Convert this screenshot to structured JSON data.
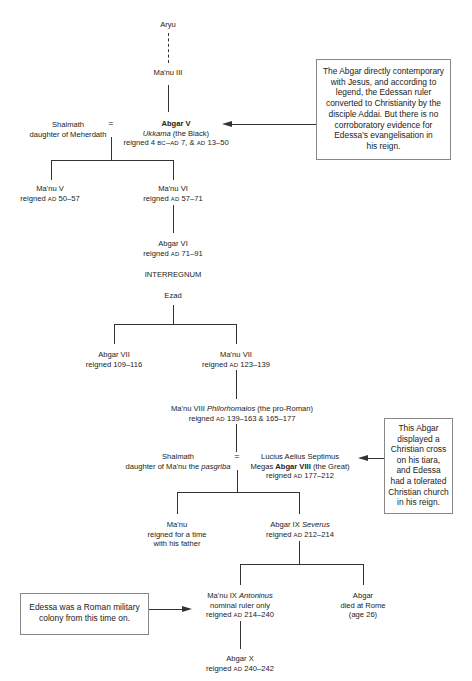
{
  "tree": {
    "aryu": "Aryu",
    "manu3": "Ma'nu III",
    "shalmath1": {
      "name": "Shalmath",
      "desc": "daughter of Meherdath"
    },
    "marriage_sign": "=",
    "abgar5": {
      "name": "Abgar V",
      "epithet": "Ukkama",
      "epithet_note": " (the Black)",
      "reign_pre": "reigned 4 ",
      "bc": "BC",
      "dash": "–",
      "ad1": "AD",
      "reign_mid": " 7, & ",
      "ad2": "AD",
      "reign_end": " 13–50"
    },
    "manu5": {
      "name": "Ma'nu V",
      "reign_pre": "reigned ",
      "ad": "AD",
      "reign": " 50–57"
    },
    "manu6": {
      "name": "Ma'nu VI",
      "reign_pre": "reigned ",
      "ad": "AD",
      "reign": " 57–71"
    },
    "abgar6": {
      "name": "Abgar VI",
      "reign_pre": "reigned ",
      "ad": "AD",
      "reign": " 71–91"
    },
    "interregnum": "INTERREGNUM",
    "ezad": "Ezad",
    "abgar7": {
      "name": "Abgar VII",
      "reign": "reigned 109–116"
    },
    "manu7": {
      "name": "Ma'nu VII",
      "reign_pre": "reigned ",
      "ad": "AD",
      "reign": " 123–139"
    },
    "manu8": {
      "name": "Ma'nu VIII ",
      "epithet": "Philorhomaios",
      "epithet_note": " (the pro-Roman)",
      "reign_pre": "reigned ",
      "ad": "AD",
      "reign": " 139–163 & 165–177"
    },
    "shalmath2": {
      "name": "Shalmath",
      "desc_pre": "daughter of Ma'nu the ",
      "desc_italic": "pasgriba"
    },
    "abgar8": {
      "line1": "Lucius Aelius Septimus",
      "pre": "Megas ",
      "name": "Abgar VIII",
      "post": " (the Great)",
      "reign_pre": "reigned ",
      "ad": "AD",
      "reign": " 177–212"
    },
    "manu_son": {
      "name": "Ma'nu",
      "line2": "reigned for a time",
      "line3": "with his father"
    },
    "abgar9": {
      "name": "Abgar IX ",
      "epithet": "Severus",
      "reign_pre": "reigned ",
      "ad": "AD",
      "reign": " 212–214"
    },
    "manu9": {
      "name": "Ma'nu IX ",
      "epithet": "Antoninus",
      "line2": "nominal ruler only",
      "reign_pre": "reigned ",
      "ad": "AD",
      "reign": " 214–240"
    },
    "abgar_rome": {
      "name": "Abgar",
      "line2": "died at Rome",
      "line3": "(age 26)"
    },
    "abgar10": {
      "name": "Abgar X",
      "reign_pre": "reigned ",
      "ad": "AD",
      "reign": " 240–242"
    }
  },
  "notes": {
    "abgar5_note": [
      "The Abgar directly contemporary",
      "with Jesus, and according to",
      "legend, the Edessan ruler",
      "converted to Christianity by the",
      "disciple Addai. But there is no",
      "corroboratory evidence for",
      "Edessa's evangelisation in",
      "his reign."
    ],
    "abgar8_note": [
      "This Abgar",
      "displayed a",
      "Christian cross",
      "on his tiara,",
      "and Edessa",
      "had a tolerated",
      "Christian church",
      "in his reign."
    ],
    "roman_colony_note": [
      "Edessa was a Roman military",
      "colony from this time on."
    ]
  }
}
